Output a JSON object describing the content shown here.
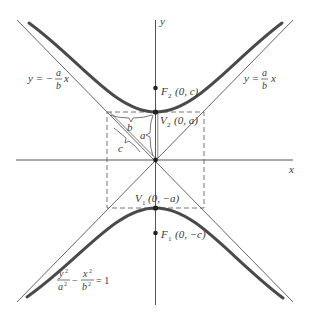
{
  "figure": {
    "axes": {
      "x_label": "x",
      "y_label": "y"
    },
    "equation": {
      "num1": "y",
      "den1": "a",
      "minus": "−",
      "num2": "x",
      "den2": "b",
      "rhs": "= 1",
      "exp": "2"
    },
    "asymptote_left": {
      "prefix": "y = −",
      "num": "a",
      "den": "b",
      "var": "x"
    },
    "asymptote_right": {
      "prefix": "y = ",
      "num": "a",
      "den": "b",
      "var": "x"
    },
    "points": {
      "f2": {
        "name": "F",
        "sub": "2",
        "coords": "(0, c)"
      },
      "v2": {
        "name": "V",
        "sub": "2",
        "coords": "(0, a)"
      },
      "v1": {
        "name": "V",
        "sub": "1",
        "coords": "(0, −a)"
      },
      "f1": {
        "name": "F",
        "sub": "1",
        "coords": "(0, −c)"
      }
    },
    "triangle_labels": {
      "a": "a",
      "b": "b",
      "c": "c"
    },
    "colors": {
      "curve": "#4a4a4a",
      "line": "#555555",
      "dashed": "#666666",
      "text": "#3a3a3a"
    }
  }
}
